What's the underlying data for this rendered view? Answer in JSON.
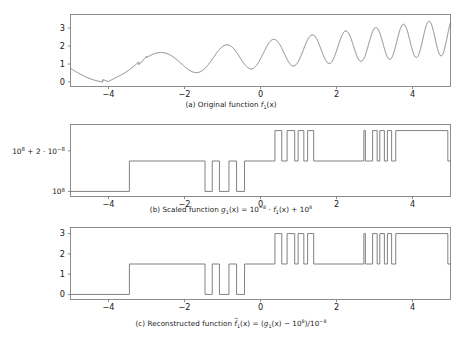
{
  "figure": {
    "background_color": "#ffffff",
    "line_color": "#6b6b6b",
    "axis_color": "#808080",
    "text_color": "#1a1a1a"
  },
  "captions": {
    "a": "(a) Original function f₁(x)",
    "b": "(b) Scaled function ĝ₁(x) = 10⁻⁸ · f₁(x) + 10⁸",
    "c": "(c) Reconstructed function f̃₁(x) = (ĝ₁(x) − 10⁸)/10⁻⁸"
  },
  "caption_parts": {
    "a_prefix": "(a) Original function",
    "b_prefix": "(b) Scaled function",
    "c_prefix": "(c) Reconstructed function",
    "fn_base": "f",
    "g_base": "g",
    "sub_one": "1",
    "arg": "(x)",
    "b_rhs_scale": "10",
    "b_exp_neg": "−8",
    "b_dot": "·",
    "b_plus": "+",
    "b_offset_base": "10",
    "b_exp_pos": "8",
    "c_minus": "−",
    "c_div": "/",
    "equals": "="
  },
  "axes": {
    "x_ticks": [
      "−4",
      "−2",
      "0",
      "2",
      "4"
    ],
    "x_tick_values": [
      -4,
      -2,
      0,
      2,
      4
    ],
    "x_range": [
      -5,
      5
    ],
    "panel_a_y_ticks": [
      "0",
      "1",
      "2",
      "3"
    ],
    "panel_a_y_tick_values": [
      0,
      1,
      2,
      3
    ],
    "panel_a_y_range": [
      -0.25,
      3.75
    ],
    "panel_b_y_ticks": [
      "10⁸",
      "10⁸ + 2 · 10⁻⁸"
    ],
    "panel_b_y_tick_values": [
      0,
      2
    ],
    "panel_b_y_range": [
      -0.25,
      3.3
    ],
    "panel_c_y_ticks": [
      "0",
      "1",
      "2",
      "3"
    ],
    "panel_c_y_tick_values": [
      0,
      1,
      2,
      3
    ],
    "panel_c_y_range": [
      -0.25,
      3.3
    ],
    "b_tick_lo_base": "10",
    "b_tick_lo_exp": "8",
    "b_tick_hi_pre": "10",
    "b_tick_hi_pre_exp": "8",
    "b_tick_hi_mid": " + 2 · 10",
    "b_tick_hi_exp": "−8"
  },
  "chart_data": [
    {
      "type": "line",
      "panel": "a",
      "title": "(a) Original function f₁(x)",
      "xlabel": "",
      "ylabel": "",
      "xlim": [
        -5,
        5
      ],
      "ylim": [
        -0.25,
        3.75
      ],
      "grid": false,
      "legend": null,
      "description": "Smooth amplitude- and frequency-modulated chirp: baseline rises from ~0.75 at x=-5, dips to ~0.0 near x=-4, then oscillates with steadily increasing frequency and amplitude toward x=5.",
      "formula_note": "f1(x) = 1.5 + 0.28*(x+5)/2*sin(0.9*(x+5)^1.85) shaped envelope (approximate)",
      "x": [
        -5.0,
        -4.8,
        -4.6,
        -4.4,
        -4.2,
        -4.0,
        -3.8,
        -3.6,
        -3.4,
        -3.2,
        -3.0,
        -2.8,
        -2.6,
        -2.4,
        -2.2,
        -2.0,
        -1.8,
        -1.6,
        -1.4,
        -1.2,
        -1.0,
        -0.8,
        -0.6,
        -0.4,
        -0.2,
        0.0,
        0.2,
        0.4,
        0.6,
        0.8,
        1.0,
        1.2,
        1.4,
        1.6,
        1.8,
        2.0,
        2.2,
        2.4,
        2.6,
        2.8,
        3.0,
        3.2,
        3.4,
        3.6,
        3.8,
        4.0,
        4.2,
        4.4,
        4.6,
        4.8,
        5.0
      ],
      "y": [
        0.75,
        0.52,
        0.33,
        0.17,
        0.05,
        0.01,
        0.12,
        0.45,
        1.02,
        1.48,
        1.62,
        1.35,
        1.02,
        1.35,
        2.05,
        1.62,
        1.0,
        1.58,
        1.22,
        0.28,
        1.3,
        0.42,
        1.48,
        0.45,
        1.62,
        0.6,
        1.85,
        0.72,
        2.05,
        0.85,
        2.15,
        0.95,
        2.25,
        1.05,
        2.35,
        1.2,
        2.5,
        1.35,
        2.65,
        1.5,
        2.85,
        1.7,
        3.1,
        1.95,
        3.35,
        2.1,
        3.45,
        2.2,
        3.5,
        2.25,
        2.95
      ]
    },
    {
      "type": "line",
      "panel": "b",
      "title": "(b) Scaled function ĝ₁(x) = 10⁻⁸ · f₁(x) + 10⁸",
      "xlabel": "",
      "ylabel": "",
      "xlim": [
        -5,
        5
      ],
      "ylim": [
        -0.25,
        3.3
      ],
      "grid": false,
      "legend": null,
      "description": "Catastrophic quantization from float64 round-off: continuous curve collapses onto three discrete levels 0, 1.5 and 3 (in units of 10^-8 above 10^8), producing a square-wave staircase.",
      "quantization_levels": [
        0,
        1.5,
        3
      ],
      "steps": [
        {
          "x_start": -5.0,
          "x_end": -3.45,
          "level": 0
        },
        {
          "x_start": -3.45,
          "x_end": -1.46,
          "level": 1.5
        },
        {
          "x_start": -1.46,
          "x_end": -1.27,
          "level": 0
        },
        {
          "x_start": -1.27,
          "x_end": -1.08,
          "level": 1.5
        },
        {
          "x_start": -1.08,
          "x_end": -0.83,
          "level": 0
        },
        {
          "x_start": -0.83,
          "x_end": -0.63,
          "level": 1.5
        },
        {
          "x_start": -0.63,
          "x_end": -0.42,
          "level": 0
        },
        {
          "x_start": -0.42,
          "x_end": 0.38,
          "level": 1.5
        },
        {
          "x_start": 0.38,
          "x_end": 0.56,
          "level": 3
        },
        {
          "x_start": 0.56,
          "x_end": 0.7,
          "level": 1.5
        },
        {
          "x_start": 0.7,
          "x_end": 0.9,
          "level": 3
        },
        {
          "x_start": 0.9,
          "x_end": 0.99,
          "level": 1.5
        },
        {
          "x_start": 0.99,
          "x_end": 1.14,
          "level": 3
        },
        {
          "x_start": 1.14,
          "x_end": 1.24,
          "level": 1.5
        },
        {
          "x_start": 1.24,
          "x_end": 1.4,
          "level": 3
        },
        {
          "x_start": 1.4,
          "x_end": 2.72,
          "level": 1.5
        },
        {
          "x_start": 2.72,
          "x_end": 2.76,
          "level": 3
        },
        {
          "x_start": 2.76,
          "x_end": 2.95,
          "level": 1.5
        },
        {
          "x_start": 2.95,
          "x_end": 3.07,
          "level": 3
        },
        {
          "x_start": 3.07,
          "x_end": 3.14,
          "level": 1.5
        },
        {
          "x_start": 3.14,
          "x_end": 3.26,
          "level": 3
        },
        {
          "x_start": 3.26,
          "x_end": 3.34,
          "level": 1.5
        },
        {
          "x_start": 3.34,
          "x_end": 3.45,
          "level": 3
        },
        {
          "x_start": 3.45,
          "x_end": 3.56,
          "level": 1.5
        },
        {
          "x_start": 3.56,
          "x_end": 4.93,
          "level": 3
        },
        {
          "x_start": 4.93,
          "x_end": 5.0,
          "level": 1.5
        }
      ]
    },
    {
      "type": "line",
      "panel": "c",
      "title": "(c) Reconstructed function f̃₁(x) = (ĝ₁(x) − 10⁸)/10⁻⁸",
      "xlabel": "",
      "ylabel": "",
      "xlim": [
        -5,
        5
      ],
      "ylim": [
        -0.25,
        3.3
      ],
      "grid": false,
      "legend": null,
      "description": "Undoing the scaling cannot recover lost bits: the reconstruction is identical in shape to panel (b), a staircase on levels 0, 1.5 and 3 instead of the smooth original.",
      "quantization_levels": [
        0,
        1.5,
        3
      ],
      "steps": [
        {
          "x_start": -5.0,
          "x_end": -3.45,
          "level": 0
        },
        {
          "x_start": -3.45,
          "x_end": -1.46,
          "level": 1.5
        },
        {
          "x_start": -1.46,
          "x_end": -1.27,
          "level": 0
        },
        {
          "x_start": -1.27,
          "x_end": -1.08,
          "level": 1.5
        },
        {
          "x_start": -1.08,
          "x_end": -0.83,
          "level": 0
        },
        {
          "x_start": -0.83,
          "x_end": -0.63,
          "level": 1.5
        },
        {
          "x_start": -0.63,
          "x_end": -0.42,
          "level": 0
        },
        {
          "x_start": -0.42,
          "x_end": 0.38,
          "level": 1.5
        },
        {
          "x_start": 0.38,
          "x_end": 0.56,
          "level": 3
        },
        {
          "x_start": 0.56,
          "x_end": 0.7,
          "level": 1.5
        },
        {
          "x_start": 0.7,
          "x_end": 0.9,
          "level": 3
        },
        {
          "x_start": 0.9,
          "x_end": 0.99,
          "level": 1.5
        },
        {
          "x_start": 0.99,
          "x_end": 1.14,
          "level": 3
        },
        {
          "x_start": 1.14,
          "x_end": 1.24,
          "level": 1.5
        },
        {
          "x_start": 1.24,
          "x_end": 1.4,
          "level": 3
        },
        {
          "x_start": 1.4,
          "x_end": 2.72,
          "level": 1.5
        },
        {
          "x_start": 2.72,
          "x_end": 2.76,
          "level": 3
        },
        {
          "x_start": 2.76,
          "x_end": 2.95,
          "level": 1.5
        },
        {
          "x_start": 2.95,
          "x_end": 3.07,
          "level": 3
        },
        {
          "x_start": 3.07,
          "x_end": 3.14,
          "level": 1.5
        },
        {
          "x_start": 3.14,
          "x_end": 3.26,
          "level": 3
        },
        {
          "x_start": 3.26,
          "x_end": 3.34,
          "level": 1.5
        },
        {
          "x_start": 3.34,
          "x_end": 3.45,
          "level": 3
        },
        {
          "x_start": 3.45,
          "x_end": 3.56,
          "level": 1.5
        },
        {
          "x_start": 3.56,
          "x_end": 4.93,
          "level": 3
        },
        {
          "x_start": 4.93,
          "x_end": 5.0,
          "level": 1.5
        }
      ]
    }
  ]
}
